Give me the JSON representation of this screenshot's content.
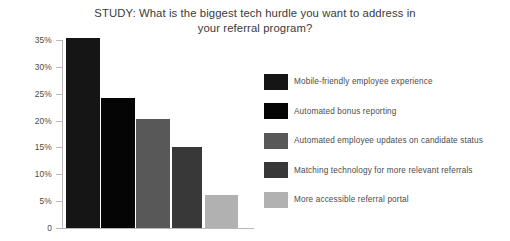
{
  "chart_data": {
    "type": "bar",
    "title": "STUDY: What is the biggest tech hurdle you want to address in your referral program?",
    "title_line1": "STUDY: What is the biggest tech hurdle you want to address in",
    "title_line2": "your referral program?",
    "xlabel": "",
    "ylabel": "",
    "ylim": [
      0,
      35
    ],
    "grid": false,
    "legend_position": "right",
    "ytick_labels": [
      "35%",
      "30%",
      "25%",
      "20%",
      "15%",
      "10%",
      "5%",
      "0"
    ],
    "ytick_values": [
      35,
      30,
      25,
      20,
      15,
      10,
      5,
      0
    ],
    "categories": [
      "Mobile-friendly employee experience",
      "Automated bonus reporting",
      "Automated employee updates on candidate status",
      "Matching technology for more relevant referrals",
      "More accessible referral portal"
    ],
    "values": [
      35,
      24,
      20,
      15,
      6
    ],
    "colors": [
      "#151515",
      "#050505",
      "#585858",
      "#383838",
      "#b1b1b1"
    ]
  },
  "legend": {
    "items": [
      {
        "label": "Mobile-friendly employee experience",
        "color": "#151515"
      },
      {
        "label": "Automated bonus reporting",
        "color": "#050505"
      },
      {
        "label": "Automated employee updates on candidate status",
        "color": "#585858"
      },
      {
        "label": "Matching technology for more relevant referrals",
        "color": "#383838"
      },
      {
        "label": "More accessible referral portal",
        "color": "#b1b1b1"
      }
    ]
  },
  "theme": {
    "background": "#ffffff",
    "axis_color": "#b9b9b9",
    "text_color": "#3b3b3b"
  }
}
